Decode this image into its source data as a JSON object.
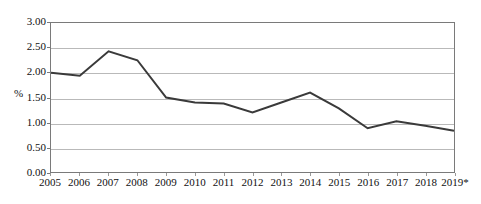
{
  "chart_data": {
    "type": "line",
    "title": "",
    "xlabel": "",
    "ylabel": "%",
    "categories": [
      "2005",
      "2006",
      "2007",
      "2008",
      "2009",
      "2010",
      "2011",
      "2012",
      "2013",
      "2014",
      "2015",
      "2016",
      "2017",
      "2018",
      "2019*"
    ],
    "values": [
      2.0,
      1.94,
      2.43,
      2.25,
      1.5,
      1.4,
      1.38,
      1.2,
      1.4,
      1.6,
      1.28,
      0.88,
      1.02,
      0.93,
      0.83
    ],
    "ylim": [
      0.0,
      3.0
    ],
    "ytick_step": 0.5,
    "ytick_labels": [
      "3.00",
      "2.50",
      "2.00",
      "1.50",
      "1.00",
      "0.50",
      "0.00"
    ],
    "ytick_values": [
      3.0,
      2.5,
      2.0,
      1.5,
      1.0,
      0.5,
      0.0
    ],
    "grid": true,
    "legend": false,
    "series_color": "#3a3a3a",
    "gridline_color": "#b9b9b9",
    "axis_color": "#7a7a7a",
    "background_color": "#ffffff",
    "footnote_marker": "*"
  }
}
